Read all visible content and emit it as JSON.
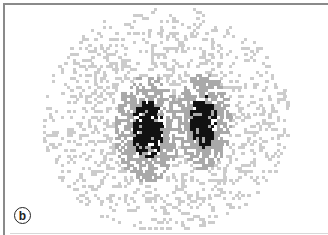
{
  "figure": {
    "panel_label": "b",
    "colors": {
      "background": "#ffffff",
      "frame": "#8a8a8a",
      "light_speckle": "#cccccc",
      "mid_gray": "#a9a9a9",
      "hot_spot": "#111111"
    },
    "regions": [
      {
        "name": "left-lobe",
        "cx": 146,
        "cy": 128,
        "rx": 16,
        "ry": 30
      },
      {
        "name": "right-lobe",
        "cx": 202,
        "cy": 120,
        "rx": 13,
        "ry": 27
      }
    ]
  }
}
